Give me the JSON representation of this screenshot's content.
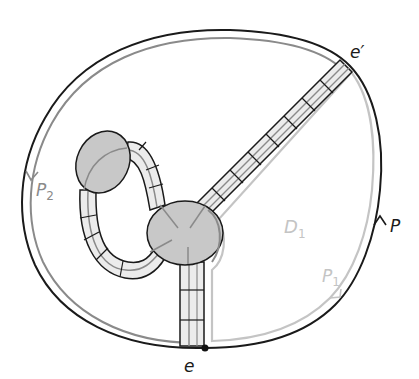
{
  "diagram": {
    "colors": {
      "outline": "#1a1a1a",
      "gray_path": "#8a8a8a",
      "light_path": "#c4c4c4",
      "disk_fill": "#c8c8c8",
      "band_fill": "#ececec",
      "background": "#ffffff"
    },
    "labels": {
      "e_prime": "e′",
      "e": "e",
      "P": "P",
      "P1_main": "P",
      "P1_sub": "1",
      "P2_main": "P",
      "P2_sub": "2",
      "D1_main": "D",
      "D1_sub": "1"
    },
    "points": {
      "e": {
        "x": 205,
        "y": 348
      },
      "e_prime": {
        "x": 347,
        "y": 62
      }
    }
  }
}
